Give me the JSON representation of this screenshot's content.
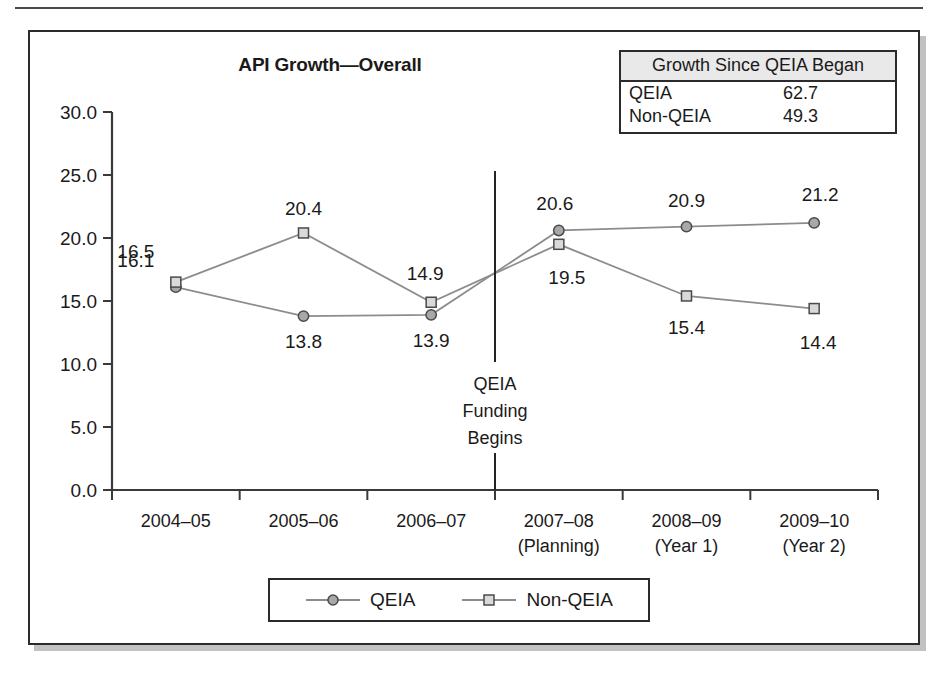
{
  "chart_data": {
    "type": "line",
    "title": "API Growth—Overall",
    "xlabel": "",
    "ylabel": "",
    "ylim": [
      0,
      30
    ],
    "yticks": [
      "0.0",
      "5.0",
      "10.0",
      "15.0",
      "20.0",
      "25.0",
      "30.0"
    ],
    "grid": false,
    "legend_position": "bottom",
    "categories": [
      "2004–05",
      "2005–06",
      "2006–07",
      "2007–08",
      "2008–09",
      "2009–10"
    ],
    "category_sublabels": [
      "",
      "",
      "",
      "(Planning)",
      "(Year 1)",
      "(Year 2)"
    ],
    "series": [
      {
        "name": "QEIA",
        "marker": "circle",
        "values": [
          16.1,
          13.8,
          13.9,
          20.6,
          20.9,
          21.2
        ],
        "labels": [
          "16.1",
          "13.8",
          "13.9",
          "20.6",
          "20.9",
          "21.2"
        ]
      },
      {
        "name": "Non-QEIA",
        "marker": "square",
        "values": [
          16.5,
          20.4,
          14.9,
          19.5,
          15.4,
          14.4
        ],
        "labels": [
          "16.5",
          "20.4",
          "14.9",
          "19.5",
          "15.4",
          "14.4"
        ]
      }
    ],
    "annotations": [
      {
        "name": "qeia-funding-divider",
        "type": "vertical-line-with-text",
        "at_category_boundary": 3,
        "lines": [
          "QEIA",
          "Funding",
          "Begins"
        ]
      }
    ]
  },
  "growth_table": {
    "header": "Growth Since QEIA Began",
    "rows": [
      {
        "label": "QEIA",
        "value": "62.7"
      },
      {
        "label": "Non-QEIA",
        "value": "49.3"
      }
    ]
  },
  "legend": {
    "items": [
      {
        "label": "QEIA",
        "marker": "circle"
      },
      {
        "label": "Non-QEIA",
        "marker": "square"
      }
    ]
  },
  "colors": {
    "line": "#8c8c8c",
    "circle_fill": "#a8a8a8",
    "square_fill": "#d9d9d9",
    "marker_stroke": "#4a4a4a",
    "axis": "#3a3a3a",
    "frame": "#2b2b2b",
    "table_header_bg": "#e9e9e9"
  }
}
